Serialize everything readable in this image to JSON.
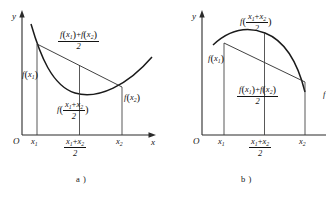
{
  "figure": {
    "type": "math-diagram",
    "panels": [
      {
        "id": "a",
        "caption": "a )",
        "curve_type": "convex",
        "axes": {
          "y_label": "y",
          "x_label": "x",
          "origin_label": "O"
        },
        "x_ticks": [
          {
            "id": "x1",
            "main": "x",
            "sub": "1"
          },
          {
            "id": "midpoint",
            "num_first": "x",
            "num_first_sub": "1",
            "num_op": "+",
            "num_second": "x",
            "num_second_sub": "2",
            "den": "2"
          },
          {
            "id": "x2",
            "main": "x",
            "sub": "2"
          }
        ],
        "labels": {
          "chord_midpoint": {
            "fname": "f",
            "num_first": "x",
            "num_first_sub": "1",
            "num_op": "+",
            "num_second": "x",
            "num_second_sub": "2",
            "den": "2",
            "form": "average-of-values"
          },
          "f_x1": {
            "fname": "f",
            "arg": "x",
            "arg_sub": "1"
          },
          "f_x2": {
            "fname": "f",
            "arg": "x",
            "arg_sub": "2"
          },
          "f_midpoint": {
            "fname": "f",
            "arg_num_first": "x",
            "arg_num_first_sub": "1",
            "arg_op": "+",
            "arg_num_second": "x",
            "arg_num_second_sub": "2",
            "arg_den": "2"
          }
        }
      },
      {
        "id": "b",
        "caption": "b )",
        "curve_type": "concave",
        "axes": {
          "y_label": "y",
          "x_label": "",
          "origin_label": "O"
        },
        "x_ticks": [
          {
            "id": "x1",
            "main": "x",
            "sub": "1"
          },
          {
            "id": "midpoint",
            "num_first": "x",
            "num_first_sub": "1",
            "num_op": "+",
            "num_second": "x",
            "num_second_sub": "2",
            "den": "2"
          },
          {
            "id": "x2",
            "main": "x",
            "sub": "2"
          }
        ],
        "labels": {
          "f_midpoint": {
            "fname": "f",
            "arg_num_first": "x",
            "arg_num_first_sub": "1",
            "arg_op": "+",
            "arg_num_second": "x",
            "arg_num_second_sub": "2",
            "arg_den": "2"
          },
          "f_x1": {
            "fname": "f",
            "arg": "x",
            "arg_sub": "1"
          },
          "chord_midpoint": {
            "fname": "f",
            "form": "average-of-values"
          },
          "f_x2_partial": "f"
        }
      }
    ],
    "colors": {
      "ink": "#1a1a1a",
      "axis": "#2b2b2b",
      "background": "#ffffff"
    }
  }
}
